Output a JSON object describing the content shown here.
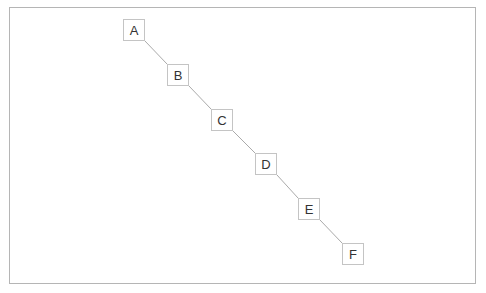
{
  "diagram": {
    "type": "tree",
    "nodes": [
      {
        "id": "A",
        "label": "A",
        "x": 123,
        "y": 19
      },
      {
        "id": "B",
        "label": "B",
        "x": 167,
        "y": 64
      },
      {
        "id": "C",
        "label": "C",
        "x": 211,
        "y": 109
      },
      {
        "id": "D",
        "label": "D",
        "x": 255,
        "y": 153
      },
      {
        "id": "E",
        "label": "E",
        "x": 298,
        "y": 198
      },
      {
        "id": "F",
        "label": "F",
        "x": 342,
        "y": 243
      }
    ],
    "edges": [
      {
        "from": "A",
        "to": "B"
      },
      {
        "from": "B",
        "to": "C"
      },
      {
        "from": "C",
        "to": "D"
      },
      {
        "from": "D",
        "to": "E"
      },
      {
        "from": "E",
        "to": "F"
      }
    ],
    "colors": {
      "border": "#b5b5b5",
      "node_border": "#c4c4c4",
      "edge": "#aaaaaa",
      "text": "#333333"
    }
  }
}
